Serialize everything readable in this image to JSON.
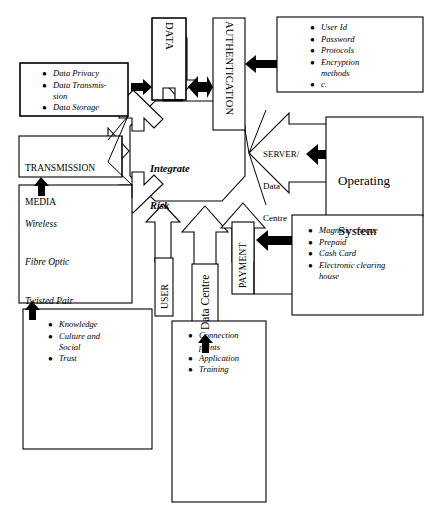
{
  "diagram": {
    "title": "Integrate Risk",
    "center": {
      "label": "Integrate\nRisk",
      "line1": "Integrate",
      "line2": "Risk"
    },
    "colors": {
      "stroke": "#000000",
      "fill": "#ffffff",
      "arrow_solid": "#000000"
    },
    "channel_labels": {
      "data": "DATA",
      "authentication": "AUTHENTICATION",
      "user": "USER",
      "data_centre": "Data Centre",
      "payment": "PAYMENT",
      "server_data_centre": "SERVER/\nData\nCentre",
      "server_line1": "SERVER/",
      "server_line2": "Data",
      "server_line3": "Centre",
      "transmission_media": "TRANSMISSION\nMEDIA",
      "transmission_line1": "TRANSMISSION",
      "transmission_line2": "MEDIA"
    },
    "boxes": {
      "data_risks": {
        "name": "data-risks-box",
        "items": [
          {
            "text": "Data Privacy",
            "continuation": ""
          },
          {
            "text": "Data Transmis-",
            "continuation": "sion"
          },
          {
            "text": "Data Storage",
            "continuation": ""
          }
        ]
      },
      "transmission_media": {
        "name": "transmission-media-box",
        "lines": [
          "TRANSMISSION",
          "MEDIA"
        ]
      },
      "media_types": {
        "name": "media-types-box",
        "lines": [
          "Wireless",
          "Fibre Optic",
          "Twisted Pair"
        ]
      },
      "human_factors": {
        "name": "human-factors-box",
        "items": [
          {
            "text": "Knowledge",
            "continuation": ""
          },
          {
            "text": "Culture and",
            "continuation": "Social"
          },
          {
            "text": "Trust",
            "continuation": ""
          }
        ]
      },
      "data_centre_details": {
        "name": "data-centre-details-box",
        "items": [
          {
            "text": "Connection",
            "continuation": "points"
          },
          {
            "text": "Application",
            "continuation": ""
          },
          {
            "text": "Training",
            "continuation": ""
          }
        ]
      },
      "authentication_details": {
        "name": "authentication-details-box",
        "items": [
          {
            "text": "User Id",
            "continuation": ""
          },
          {
            "text": "Password",
            "continuation": ""
          },
          {
            "text": "Protocols",
            "continuation": ""
          },
          {
            "text": "Encryption",
            "continuation": "methods"
          },
          {
            "text": "c.",
            "continuation": ""
          }
        ]
      },
      "operating_system": {
        "name": "operating-system-box",
        "lines": [
          "Operating",
          "System"
        ],
        "line1": "Operating",
        "line2": "System"
      },
      "payment_methods": {
        "name": "payment-methods-box",
        "items": [
          {
            "text": "Magnetic cheque",
            "continuation": ""
          },
          {
            "text": "Prepaid",
            "continuation": ""
          },
          {
            "text": "Cash Card",
            "continuation": ""
          },
          {
            "text": "Electronic clearing",
            "continuation": "house"
          }
        ]
      }
    }
  }
}
